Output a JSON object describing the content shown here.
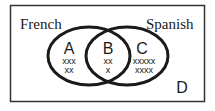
{
  "diagram": {
    "type": "venn",
    "sets": [
      {
        "name": "French",
        "label": "French"
      },
      {
        "name": "Spanish",
        "label": "Spanish"
      }
    ],
    "regions": {
      "A": {
        "label": "A",
        "marks": [
          "xxx",
          "xx"
        ],
        "count": 5,
        "description": "French only"
      },
      "B": {
        "label": "B",
        "marks": [
          "xx",
          "x"
        ],
        "count": 3,
        "description": "French and Spanish"
      },
      "C": {
        "label": "C",
        "marks": [
          "xxxxx",
          "xxxx"
        ],
        "count": 9,
        "description": "Spanish only"
      },
      "D": {
        "label": "D",
        "marks": [],
        "description": "Neither"
      }
    },
    "colors": {
      "stroke": "#1a1a1a",
      "background": "#ffffff",
      "frame": "#333333"
    }
  }
}
